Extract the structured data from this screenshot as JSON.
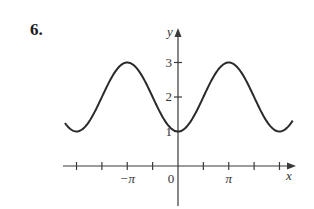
{
  "problem": {
    "number": "6."
  },
  "chart_data": {
    "type": "line",
    "title": "",
    "function": "y = 2 - cos(x)",
    "xlabel": "x",
    "ylabel": "y",
    "x_tick_labels": [
      {
        "value": -3.14159,
        "label": "−π"
      },
      {
        "value": 0,
        "label": "0"
      },
      {
        "value": 3.14159,
        "label": "π"
      }
    ],
    "x_tick_spacing": "π/2",
    "x_ticks": [
      -6.2832,
      -4.7124,
      -3.1416,
      -1.5708,
      1.5708,
      3.1416,
      4.7124,
      6.2832
    ],
    "y_ticks": [
      {
        "value": 1,
        "label": "1"
      },
      {
        "value": 2,
        "label": "2"
      },
      {
        "value": 3,
        "label": "3"
      }
    ],
    "xlim": [
      -7.1,
      7.1
    ],
    "ylim": [
      -1.2,
      4.0
    ],
    "curve_domain": [
      -7.0,
      7.1
    ],
    "series": [
      {
        "name": "2 - cos x",
        "x": [
          -7.0,
          -6.2832,
          -4.7124,
          -3.1416,
          -1.5708,
          0,
          1.5708,
          3.1416,
          4.7124,
          6.2832,
          7.1
        ],
        "values": [
          1.25,
          1,
          2,
          3,
          2,
          1,
          2,
          3,
          2,
          1,
          1.31
        ]
      }
    ],
    "grid": false,
    "legend": null,
    "colors": {
      "curve": "#2a2a2a",
      "axis": "#3a3a3a"
    }
  },
  "pixel_map": {
    "origin_x": 178,
    "origin_y": 166,
    "px_per_x": 16.15,
    "px_per_y": 34.5
  }
}
